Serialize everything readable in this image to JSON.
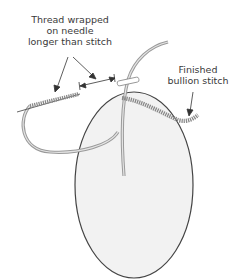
{
  "diagram": {
    "title": "Bullion stitch",
    "labels": {
      "thread_wrapped": [
        "Thread wrapped",
        "on needle",
        "longer than stitch"
      ],
      "finished": [
        "Finished",
        "bullion stitch"
      ]
    },
    "colors": {
      "fabric_fill": "#f2f2f2",
      "fabric_outline": "#444444",
      "thread": "#9a9a9a",
      "thread_light": "#dcdcdc",
      "arrow": "#333333",
      "text": "#3a3a3a"
    }
  }
}
